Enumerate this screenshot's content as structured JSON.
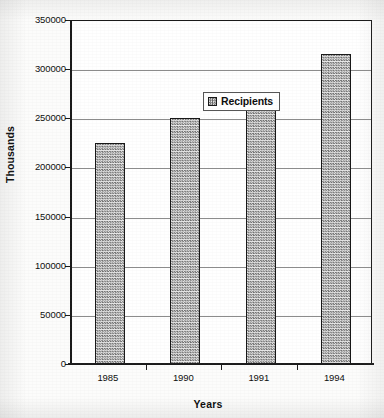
{
  "chart_data": {
    "type": "bar",
    "title": "",
    "categories": [
      "1985",
      "1990",
      "1991",
      "1994"
    ],
    "values": [
      225000,
      250000,
      275000,
      315000
    ],
    "series": [
      {
        "name": "Recipients",
        "values": [
          225000,
          250000,
          275000,
          315000
        ]
      }
    ],
    "xlabel": "Years",
    "ylabel": "Thousands",
    "ylim": [
      0,
      350000
    ],
    "yticks": [
      0,
      50000,
      100000,
      150000,
      200000,
      250000,
      300000,
      350000
    ],
    "ytick_labels": [
      "0",
      "50000",
      "100000",
      "150000",
      "200000",
      "250000",
      "300000",
      "350000"
    ],
    "grid": "horizontal",
    "legend": {
      "position": "inside-upper-left",
      "entries": [
        {
          "label": "Recipients",
          "swatch": "checkered-gray-pattern"
        }
      ]
    },
    "colors": {
      "bar_fill": "#b9b9b9",
      "bar_pattern": "#6e6e6e",
      "bar_border": "#171717",
      "gridline": "#8c8c8c",
      "axis": "#1a1a1a",
      "text": "#0d0d0d",
      "plot_background": "#ffffff",
      "page_background": "#fcfcfb"
    }
  }
}
